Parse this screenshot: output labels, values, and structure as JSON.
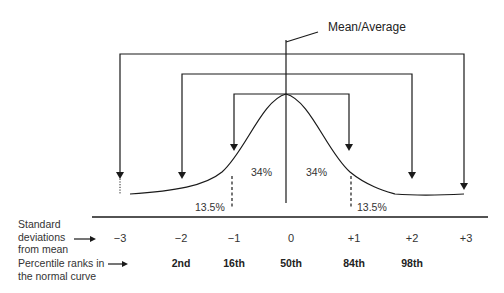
{
  "diagram": {
    "title_label": "Mean/Average",
    "regions": {
      "center_left": "34%",
      "center_right": "34%",
      "outer_left": "13.5%",
      "outer_right": "13.5%"
    },
    "rows": {
      "standard_deviations_label": "Standard deviations from mean",
      "standard_deviations_label_lines": [
        "Standard",
        "deviations",
        "from mean"
      ],
      "percentile_label_lines": [
        "Percentile ranks in",
        "the normal curve"
      ]
    },
    "standard_deviations": [
      "−3",
      "−2",
      "−1",
      "0",
      "+1",
      "+2",
      "+3"
    ],
    "percentile_ranks": [
      "",
      "2nd",
      "16th",
      "50th",
      "84th",
      "98th",
      ""
    ],
    "colors": {
      "line": "#1a1a1a",
      "background": "#ffffff"
    }
  }
}
